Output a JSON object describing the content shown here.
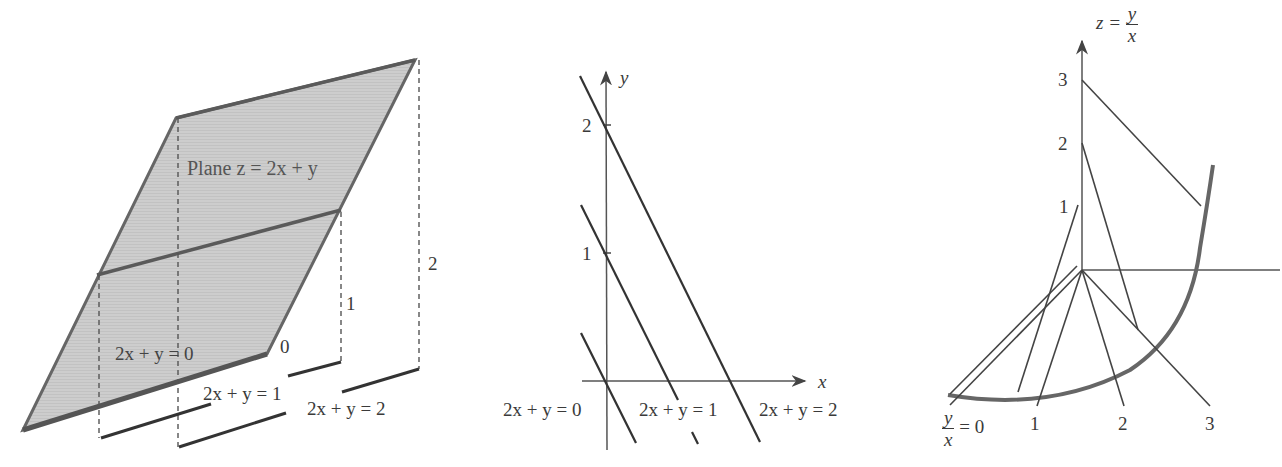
{
  "figure": {
    "left_panel": {
      "title_label": "Plane z = 2x + y",
      "line_labels": [
        "2x + y = 0",
        "2x + y = 1",
        "2x + y = 2"
      ],
      "height_labels": [
        "0",
        "1",
        "2"
      ]
    },
    "middle_panel": {
      "x_axis_label": "x",
      "y_axis_label": "y",
      "y_ticks": [
        "1",
        "2"
      ],
      "line_labels": [
        "2x + y = 0",
        "2x + y = 1",
        "2x + y = 2"
      ]
    },
    "right_panel": {
      "z_axis_label": "z =",
      "z_axis_frac": {
        "num": "y",
        "den": "x"
      },
      "z_ticks": [
        "1",
        "2",
        "3"
      ],
      "base_label_frac": {
        "num": "y",
        "den": "x"
      },
      "base_label_suffix": "= 0",
      "base_ticks": [
        "1",
        "2",
        "3"
      ]
    },
    "colors": {
      "plane_fill": "#c9c9c9",
      "stroke": "#4a4a4a",
      "dashed": "#555555"
    }
  }
}
